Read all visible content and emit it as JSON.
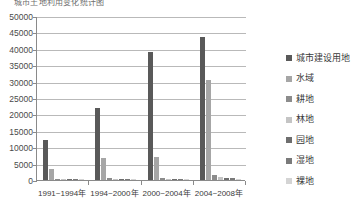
{
  "top_title": "城市土地利用变化统计图",
  "chart_data": {
    "type": "bar",
    "title": "",
    "xlabel": "",
    "ylabel": "",
    "ylim": [
      0,
      50000
    ],
    "ytick_step": 5000,
    "grid": true,
    "legend_position": "right",
    "categories": [
      "1991~1994年",
      "1994~2000年",
      "2000~2004年",
      "2004~2008年"
    ],
    "ytick_labels": [
      "0",
      "5000",
      "10000",
      "15000",
      "20000",
      "25000",
      "30000",
      "35000",
      "40000",
      "45000",
      "50000"
    ],
    "ytick_values": [
      0,
      5000,
      10000,
      15000,
      20000,
      25000,
      30000,
      35000,
      40000,
      45000,
      50000
    ],
    "series": [
      {
        "name": "城市建设用地",
        "color": "#595959",
        "values": [
          12100,
          22000,
          39100,
          43600
        ]
      },
      {
        "name": "水域",
        "color": "#a6a6a6",
        "values": [
          3400,
          6600,
          7100,
          30500
        ]
      },
      {
        "name": "耕地",
        "color": "#8c8c8c",
        "values": [
          420,
          520,
          500,
          1650
        ]
      },
      {
        "name": "林地",
        "color": "#c4c4c4",
        "values": [
          180,
          230,
          260,
          900
        ]
      },
      {
        "name": "园地",
        "color": "#6e6e6e",
        "values": [
          160,
          200,
          220,
          700
        ]
      },
      {
        "name": "湿地",
        "color": "#7a7a7a",
        "values": [
          120,
          150,
          170,
          500
        ]
      },
      {
        "name": "裸地",
        "color": "#d4d4d4",
        "values": [
          90,
          110,
          130,
          380
        ]
      }
    ]
  }
}
